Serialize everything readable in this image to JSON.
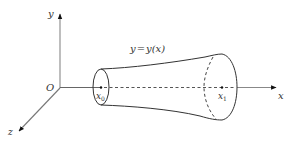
{
  "diagram": {
    "type": "solid-of-revolution",
    "axes": {
      "x_label": "x",
      "y_label": "y",
      "z_label": "z",
      "origin_label": "O"
    },
    "curve_label": "y = y(x)",
    "curve_label_parts": {
      "lhs": "y",
      "eq": "=",
      "rhs": "y(x)"
    },
    "bounds": {
      "left": {
        "base": "x",
        "sub": "0"
      },
      "right": {
        "base": "x",
        "sub": "1"
      }
    },
    "colors": {
      "axis": "#666666",
      "curve": "#333333",
      "text": "#333333",
      "background": "#ffffff"
    }
  }
}
